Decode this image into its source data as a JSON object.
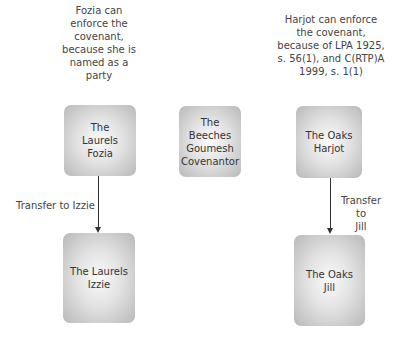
{
  "notes": {
    "left": "Fozia can enforce the covenant, because she is named as a party",
    "right": "Harjot can enforce the covenant, because of LPA 1925, s. 56(1), and C(RTP)A 1999, s. 1(1)"
  },
  "boxes": {
    "laurels_fozia": {
      "line1": "The",
      "line2": "Laurels",
      "line3": "Fozia"
    },
    "beeches_goumesh": {
      "line1": "The",
      "line2": "Beeches",
      "line3": "Goumesh",
      "line4": "Covenantor"
    },
    "oaks_harjot": {
      "line1": "The Oaks",
      "line2": "Harjot"
    },
    "laurels_izzie": {
      "line1": "The Laurels",
      "line2": "Izzie"
    },
    "oaks_jill": {
      "line1": "The Oaks",
      "line2": "Jill"
    }
  },
  "transfers": {
    "left": "Transfer to Izzie",
    "right_line1": "Transfer to",
    "right_line2": "Jill"
  }
}
